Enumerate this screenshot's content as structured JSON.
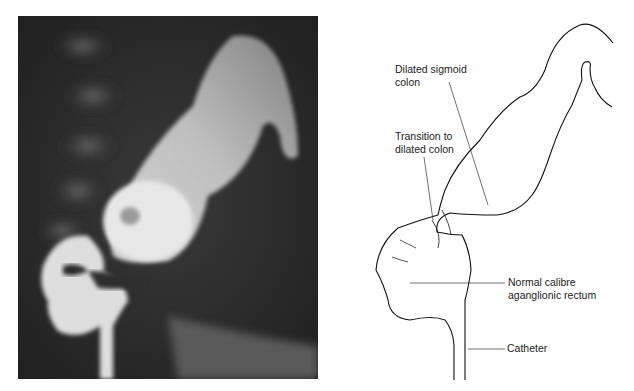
{
  "figure": {
    "panels": [
      {
        "id": "radiograph",
        "type": "barium enema x-ray"
      },
      {
        "id": "line-drawing",
        "type": "annotated tracing"
      }
    ],
    "labels": {
      "dilated_sigmoid_line1": "Dilated sigmoid",
      "dilated_sigmoid_line2": "colon",
      "transition_line1": "Transition to",
      "transition_line2": "dilated colon",
      "rectum_line1": "Normal calibre",
      "rectum_line2": "aganglionic rectum",
      "catheter": "Catheter"
    }
  }
}
